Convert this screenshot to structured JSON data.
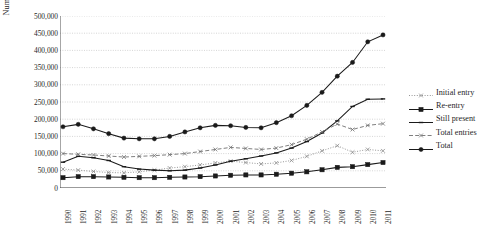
{
  "axis": {
    "ylabel": "Number of TFW's",
    "yticks": [
      "500,000",
      "450,000",
      "400,000",
      "350,000",
      "300,000",
      "250,000",
      "200,000",
      "150,000",
      "100,000",
      "50,000",
      "0"
    ],
    "xticks": [
      "1990",
      "1991",
      "1992",
      "1993",
      "1994",
      "1995",
      "1996",
      "1997",
      "1998",
      "1999",
      "2000",
      "2001",
      "2002",
      "2003",
      "2004",
      "2005",
      "2006",
      "2007",
      "2008",
      "2009",
      "2010",
      "2011"
    ]
  },
  "legend": {
    "items": [
      {
        "label": "Initial entry",
        "key": "initial-entry-key"
      },
      {
        "label": "Re-entry",
        "key": "re-entry-key"
      },
      {
        "label": "Still present",
        "key": "still-present-key"
      },
      {
        "label": "Total entries",
        "key": "total-entries-key"
      },
      {
        "label": "Total",
        "key": "total-key"
      }
    ]
  },
  "chart_data": {
    "type": "line",
    "title": "",
    "xlabel": "",
    "ylabel": "Number of TFW's",
    "ylim": [
      0,
      500000
    ],
    "ytick_step": 50000,
    "grid": true,
    "legend_position": "right",
    "categories": [
      "1990",
      "1991",
      "1992",
      "1993",
      "1994",
      "1995",
      "1996",
      "1997",
      "1998",
      "1999",
      "2000",
      "2001",
      "2002",
      "2003",
      "2004",
      "2005",
      "2006",
      "2007",
      "2008",
      "2009",
      "2010",
      "2011"
    ],
    "series": [
      {
        "name": "Initial entry",
        "style": "dotted",
        "marker": "x",
        "values": [
          55000,
          52000,
          48000,
          45000,
          44000,
          47000,
          52000,
          58000,
          62000,
          67000,
          73000,
          78000,
          74000,
          70000,
          73000,
          80000,
          92000,
          108000,
          123000,
          104000,
          112000,
          108000
        ]
      },
      {
        "name": "Re-entry",
        "style": "solid",
        "marker": "square",
        "values": [
          30000,
          33000,
          33000,
          32000,
          31000,
          30000,
          30000,
          31000,
          32000,
          33000,
          35000,
          37000,
          38000,
          38000,
          40000,
          43000,
          47000,
          53000,
          60000,
          62000,
          68000,
          74000
        ]
      },
      {
        "name": "Still present",
        "style": "solid",
        "marker": "dash",
        "values": [
          75000,
          92000,
          88000,
          80000,
          62000,
          55000,
          52000,
          50000,
          52000,
          58000,
          67000,
          78000,
          85000,
          93000,
          102000,
          116000,
          135000,
          160000,
          195000,
          237000,
          258000,
          259000
        ]
      },
      {
        "name": "Total entries",
        "style": "dashed",
        "marker": "x",
        "values": [
          100000,
          98000,
          96000,
          93000,
          90000,
          92000,
          94000,
          97000,
          100000,
          106000,
          112000,
          118000,
          115000,
          112000,
          116000,
          126000,
          142000,
          163000,
          186000,
          170000,
          182000,
          187000
        ]
      },
      {
        "name": "Total",
        "style": "solid",
        "marker": "circle",
        "values": [
          178000,
          185000,
          172000,
          158000,
          145000,
          143000,
          143000,
          150000,
          163000,
          175000,
          182000,
          181000,
          176000,
          175000,
          190000,
          210000,
          240000,
          278000,
          325000,
          365000,
          425000,
          445000
        ]
      }
    ]
  }
}
